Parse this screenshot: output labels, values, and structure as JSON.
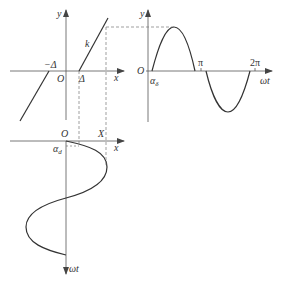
{
  "figure": {
    "colors": {
      "curve": "#333333",
      "axis": "#555555",
      "dashed": "#777777",
      "background": "#ffffff"
    }
  },
  "characteristic_plot": {
    "y_axis_label": "y",
    "x_axis_label": "x",
    "origin_label": "O",
    "neg_threshold_label": "−Δ",
    "pos_threshold_label": "Δ",
    "slope_label": "k"
  },
  "output_plot": {
    "y_axis_label": "y",
    "x_axis_label": "ωt",
    "origin_label": "O",
    "phase_label": "α",
    "phase_sub": "δ",
    "pi_label": "π",
    "two_pi_label": "2π"
  },
  "input_plot": {
    "origin_label": "O",
    "amplitude_label": "X",
    "x_axis_label": "x",
    "time_axis_label": "ωt",
    "phase_label": "α",
    "phase_sub": "d"
  }
}
